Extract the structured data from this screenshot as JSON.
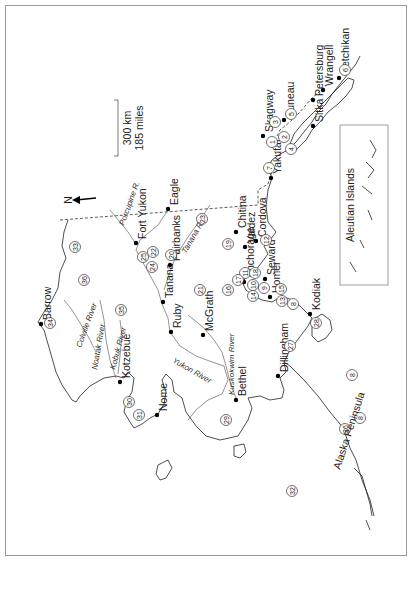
{
  "map": {
    "title": "Alaska",
    "orientation_note": "rotated 90° counter-clockwise",
    "north_arrow": {
      "label": "N"
    },
    "scale_bar": {
      "km_label": "300 km",
      "miles_label": "185 miles"
    },
    "inset": {
      "label": "Aleutian Islands"
    },
    "cities": [
      {
        "name": "Barrow",
        "x": 41,
        "y": 324
      },
      {
        "name": "Kotzebue",
        "x": 120,
        "y": 382
      },
      {
        "name": "Nome",
        "x": 157,
        "y": 415
      },
      {
        "name": "Bethel",
        "x": 236,
        "y": 400
      },
      {
        "name": "Dillingham",
        "x": 278,
        "y": 376
      },
      {
        "name": "McGrath",
        "x": 203,
        "y": 335
      },
      {
        "name": "Ruby",
        "x": 171,
        "y": 332
      },
      {
        "name": "Tanana",
        "x": 163,
        "y": 302
      },
      {
        "name": "Fairbanks",
        "x": 170,
        "y": 265
      },
      {
        "name": "Fort Yukon",
        "x": 136,
        "y": 243
      },
      {
        "name": "Eagle",
        "x": 168,
        "y": 209
      },
      {
        "name": "Chitina",
        "x": 236,
        "y": 232
      },
      {
        "name": "Valdez",
        "x": 245,
        "y": 247
      },
      {
        "name": "Cordova",
        "x": 256,
        "y": 241
      },
      {
        "name": "Anchorage",
        "x": 244,
        "y": 282
      },
      {
        "name": "Seward",
        "x": 265,
        "y": 279
      },
      {
        "name": "Homer",
        "x": 270,
        "y": 297
      },
      {
        "name": "Kodiak",
        "x": 310,
        "y": 314
      },
      {
        "name": "Yakutat",
        "x": 271,
        "y": 178
      },
      {
        "name": "Skagway",
        "x": 263,
        "y": 136
      },
      {
        "name": "Juneau",
        "x": 284,
        "y": 120
      },
      {
        "name": "Petersburg",
        "x": 313,
        "y": 100
      },
      {
        "name": "Wrangell",
        "x": 323,
        "y": 90
      },
      {
        "name": "Ketchikan",
        "x": 339,
        "y": 78
      },
      {
        "name": "Sitka",
        "x": 313,
        "y": 126
      }
    ],
    "rivers": [
      "Porcupine R.",
      "Tanana R.",
      "Colville River",
      "Noatak River",
      "Kobuk River",
      "Yukon River",
      "Kuskokwim River"
    ],
    "regions": [
      "Alaska Peninsula"
    ],
    "region_numbers": [
      {
        "n": "1",
        "x": 272,
        "y": 142
      },
      {
        "n": "2",
        "x": 284,
        "y": 137
      },
      {
        "n": "3",
        "x": 275,
        "y": 122
      },
      {
        "n": "4",
        "x": 291,
        "y": 149
      },
      {
        "n": "5",
        "x": 291,
        "y": 114
      },
      {
        "n": "6",
        "x": 345,
        "y": 70
      },
      {
        "n": "7",
        "x": 269,
        "y": 168
      },
      {
        "n": "8",
        "x": 293,
        "y": 304
      },
      {
        "n": "8",
        "x": 352,
        "y": 375
      },
      {
        "n": "8",
        "x": 360,
        "y": 418
      },
      {
        "n": "9",
        "x": 264,
        "y": 288
      },
      {
        "n": "10",
        "x": 253,
        "y": 285
      },
      {
        "n": "11",
        "x": 245,
        "y": 273
      },
      {
        "n": "12",
        "x": 266,
        "y": 240
      },
      {
        "n": "13",
        "x": 282,
        "y": 301
      },
      {
        "n": "14",
        "x": 253,
        "y": 296
      },
      {
        "n": "15",
        "x": 281,
        "y": 289
      },
      {
        "n": "16",
        "x": 228,
        "y": 290
      },
      {
        "n": "17",
        "x": 238,
        "y": 280
      },
      {
        "n": "18",
        "x": 255,
        "y": 273
      },
      {
        "n": "19",
        "x": 228,
        "y": 244
      },
      {
        "n": "20",
        "x": 171,
        "y": 255
      },
      {
        "n": "21",
        "x": 200,
        "y": 290
      },
      {
        "n": "22",
        "x": 153,
        "y": 252
      },
      {
        "n": "23",
        "x": 202,
        "y": 219
      },
      {
        "n": "24",
        "x": 152,
        "y": 267
      },
      {
        "n": "25",
        "x": 143,
        "y": 257
      },
      {
        "n": "26",
        "x": 345,
        "y": 429
      },
      {
        "n": "27",
        "x": 290,
        "y": 346
      },
      {
        "n": "28",
        "x": 316,
        "y": 323
      },
      {
        "n": "29",
        "x": 226,
        "y": 420
      },
      {
        "n": "30",
        "x": 129,
        "y": 402
      },
      {
        "n": "31",
        "x": 139,
        "y": 415
      },
      {
        "n": "32",
        "x": 292,
        "y": 491
      },
      {
        "n": "33",
        "x": 75,
        "y": 247
      },
      {
        "n": "34",
        "x": 50,
        "y": 323
      },
      {
        "n": "35",
        "x": 121,
        "y": 310
      },
      {
        "n": "36",
        "x": 84,
        "y": 280
      }
    ]
  }
}
